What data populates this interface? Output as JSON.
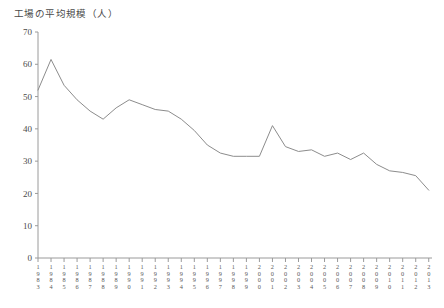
{
  "chart_data": {
    "type": "line",
    "title": "工場の平均規模（人）",
    "xlabel": "",
    "ylabel": "",
    "ylim": [
      0,
      70
    ],
    "ytick_step": 10,
    "yticks": [
      0,
      10,
      20,
      30,
      40,
      50,
      60,
      70
    ],
    "grid": false,
    "legend": "none",
    "line_color": "#8c8c8c",
    "axis_color": "#9a9a9a",
    "categories": [
      "1983",
      "1984",
      "1985",
      "1986",
      "1987",
      "1988",
      "1989",
      "1990",
      "1991",
      "1992",
      "1993",
      "1994",
      "1995",
      "1996",
      "1997",
      "1998",
      "1999",
      "2000",
      "2001",
      "2002",
      "2003",
      "2004",
      "2005",
      "2006",
      "2007",
      "2008",
      "2009",
      "2010",
      "2011",
      "2012",
      "2013"
    ],
    "values": [
      52.0,
      61.5,
      53.5,
      49.0,
      45.5,
      43.0,
      46.5,
      49.0,
      47.5,
      46.0,
      45.5,
      43.0,
      39.5,
      35.0,
      32.5,
      31.5,
      31.5,
      31.5,
      41.0,
      34.5,
      33.0,
      33.5,
      31.5,
      32.5,
      30.5,
      32.5,
      29.0,
      27.0,
      26.5,
      25.5,
      21.0
    ],
    "series_name": "工場の平均規模"
  },
  "axis": {
    "ytick_labels": [
      "70",
      "60",
      "50",
      "40",
      "30",
      "20",
      "10",
      "0"
    ]
  }
}
